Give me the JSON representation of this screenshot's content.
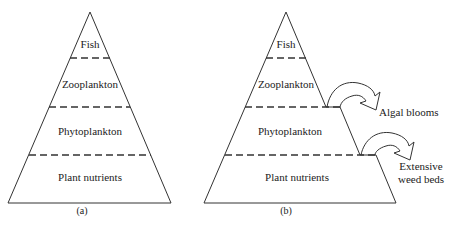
{
  "panels": [
    {
      "caption": "(a)",
      "levels": [
        "Fish",
        "Zooplankton",
        "Phytoplankton",
        "Plant nutrients"
      ]
    },
    {
      "caption": "(b)",
      "levels": [
        "Fish",
        "Zooplankton",
        "Phytoplankton",
        "Plant nutrients"
      ],
      "annotations": [
        "Algal blooms",
        "Extensive weed beds"
      ],
      "annotation_lines": {
        "weed_line1": "Extensive",
        "weed_line2": "weed beds"
      }
    }
  ]
}
